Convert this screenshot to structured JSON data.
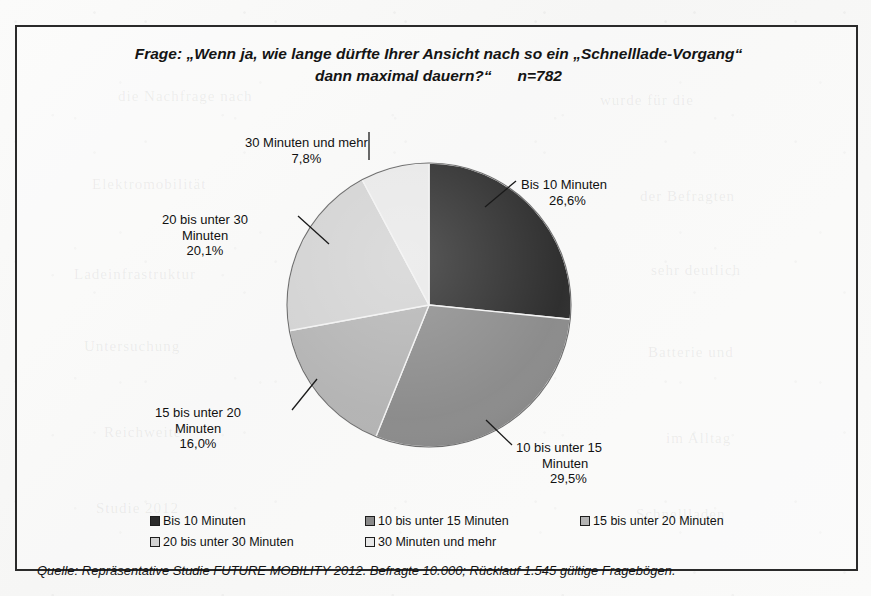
{
  "title": {
    "line1": "Frage: „Wenn ja, wie lange dürfte Ihrer Ansicht nach so ein „Schnelllade-Vorgang“",
    "line2": "dann maximal dauern?“",
    "n_value": "n=782"
  },
  "footer": {
    "source": "Quelle: Repräsentative Studie FUTURE MOBILITY 2012. Befragte 10.000; Rücklauf 1.545 gültige Fragebögen."
  },
  "legend": {
    "items": [
      {
        "label": "Bis 10 Minuten",
        "color": "#2b2b2b"
      },
      {
        "label": "10 bis unter 15 Minuten",
        "color": "#8a8a8a"
      },
      {
        "label": "15 bis unter 20 Minuten",
        "color": "#b3b3b3"
      },
      {
        "label": "20 bis unter 30 Minuten",
        "color": "#d2d2d2"
      },
      {
        "label": "30 Minuten und mehr",
        "color": "#e8e8e8"
      }
    ]
  },
  "callouts": {
    "bis10": {
      "name": "Bis 10 Minuten",
      "pct": "26,6%"
    },
    "u15": {
      "name_l1": "10 bis unter 15",
      "name_l2": "Minuten",
      "pct": "29,5%"
    },
    "u20": {
      "name_l1": "15 bis unter 20",
      "name_l2": "Minuten",
      "pct": "16,0%"
    },
    "u30": {
      "name_l1": "20 bis unter 30",
      "name_l2": "Minuten",
      "pct": "20,1%"
    },
    "mehr": {
      "name": "30 Minuten und mehr",
      "pct": "7,8%"
    }
  },
  "ghost_marks": [
    {
      "text": "die Nachfrage nach",
      "x": 118,
      "y": 88,
      "rot": 0
    },
    {
      "text": "wurde für die",
      "x": 600,
      "y": 92,
      "rot": 0
    },
    {
      "text": "Elektromobilität",
      "x": 92,
      "y": 176,
      "rot": 0
    },
    {
      "text": "der Befragten",
      "x": 640,
      "y": 188,
      "rot": 0
    },
    {
      "text": "Ladeinfrastruktur",
      "x": 74,
      "y": 266,
      "rot": 0
    },
    {
      "text": "sehr deutlich",
      "x": 651,
      "y": 262,
      "rot": 0
    },
    {
      "text": "Untersuchung",
      "x": 84,
      "y": 338,
      "rot": 0
    },
    {
      "text": "Batterie und",
      "x": 648,
      "y": 344,
      "rot": 0
    },
    {
      "text": "Reichweite",
      "x": 104,
      "y": 424,
      "rot": 0
    },
    {
      "text": "im Alltag",
      "x": 666,
      "y": 430,
      "rot": 0
    },
    {
      "text": "Studie 2012",
      "x": 96,
      "y": 500,
      "rot": 0
    },
    {
      "text": "Schnellladen",
      "x": 636,
      "y": 506,
      "rot": 0
    }
  ],
  "chart_data": {
    "type": "pie",
    "title": "Frage: „Wenn ja, wie lange dürfte Ihrer Ansicht nach so ein „Schnelllade-Vorgang“ dann maximal dauern?“",
    "n": 782,
    "unit": "%",
    "start_angle_deg": 0,
    "direction": "clockwise",
    "legend_position": "bottom",
    "grid": false,
    "categories": [
      "Bis 10 Minuten",
      "10 bis unter 15 Minuten",
      "15 bis unter 20 Minuten",
      "20 bis unter 30 Minuten",
      "30 Minuten und mehr"
    ],
    "values": [
      26.6,
      29.5,
      16.0,
      20.1,
      7.8
    ],
    "value_labels": [
      "26,6%",
      "29,5%",
      "16,0%",
      "20,1%",
      "7,8%"
    ],
    "colors": [
      "#2b2b2b",
      "#8a8a8a",
      "#b3b3b3",
      "#d2d2d2",
      "#e8e8e8"
    ],
    "source": "Quelle: Repräsentative Studie FUTURE MOBILITY 2012. Befragte 10.000; Rücklauf 1.545 gültige Fragebögen."
  }
}
